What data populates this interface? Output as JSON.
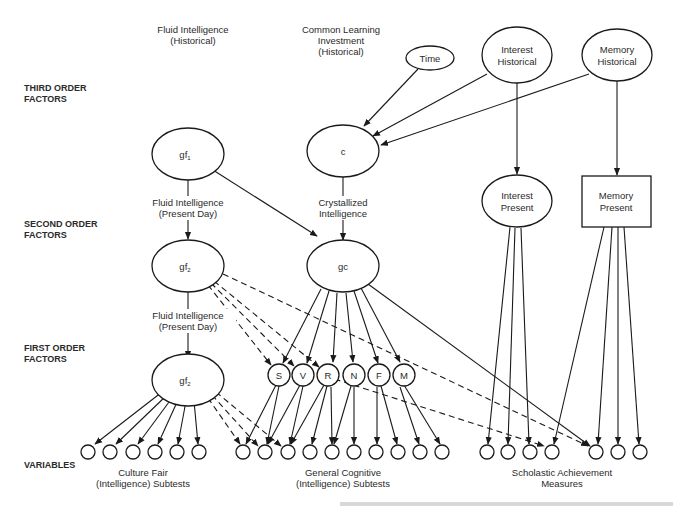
{
  "levels": {
    "third": [
      "THIRD ORDER",
      "FACTORS"
    ],
    "second": [
      "SECOND ORDER",
      "FACTORS"
    ],
    "first": [
      "FIRST ORDER",
      "FACTORS"
    ],
    "variables": "VARIABLES"
  },
  "headers": {
    "fluid_historical": [
      "Fluid Intelligence",
      "(Historical)"
    ],
    "common_learning": [
      "Common Learning",
      "Investment",
      "(Historical)"
    ]
  },
  "nodes": {
    "time": "Time",
    "interest_historical": [
      "Interest",
      "Historical"
    ],
    "memory_historical": [
      "Memory",
      "Historical"
    ],
    "gf1": "gf",
    "gf1_sub": "1",
    "c": "c",
    "interest_present": [
      "Interest",
      "Present"
    ],
    "memory_present": [
      "Memory",
      "Present"
    ],
    "gf2": "gf",
    "gf2_sub": "2",
    "gc": "gc",
    "gf2b": "gf",
    "gf2b_sub": "2",
    "primaries": [
      "S",
      "V",
      "R",
      "N",
      "F",
      "M"
    ]
  },
  "edge_labels": {
    "fluid_present_1": [
      "Fluid Intelligence",
      "(Present Day)"
    ],
    "crystallized": [
      "Crystallized",
      "Intelligence"
    ],
    "fluid_present_2": [
      "Fluid Intelligence",
      "(Present Day)"
    ]
  },
  "variable_groups": {
    "culture_fair": [
      "Culture Fair",
      "(Intelligence) Subtests"
    ],
    "general_cognitive": [
      "General Cognitive",
      "(Intelligence) Subtests"
    ],
    "scholastic": [
      "Scholastic Achievement",
      "Measures"
    ]
  }
}
